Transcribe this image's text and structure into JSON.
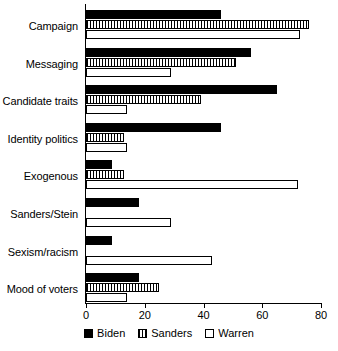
{
  "chart_data": {
    "type": "bar",
    "orientation": "horizontal",
    "title": "",
    "subtitle": "",
    "xlabel": "",
    "ylabel": "",
    "xlim": [
      0,
      80
    ],
    "xticks": [
      0,
      20,
      40,
      60,
      80
    ],
    "xtick_labels": [
      "0",
      "20",
      "40",
      "60",
      "80"
    ],
    "grid": false,
    "legend_position": "bottom",
    "categories": [
      "Campaign",
      "Messaging",
      "Candidate traits",
      "Identity politics",
      "Exogenous",
      "Sanders/Stein",
      "Sexism/racism",
      "Mood of voters"
    ],
    "series": [
      {
        "name": "Biden",
        "color": "#000000",
        "fill": "solid-black",
        "values": [
          46,
          56,
          65,
          46,
          9,
          18,
          9,
          18
        ]
      },
      {
        "name": "Sanders",
        "color": "#000000",
        "fill": "vertical-hatch",
        "values": [
          76,
          51,
          39,
          13,
          13,
          0,
          0,
          25
        ]
      },
      {
        "name": "Warren",
        "color": "#000000",
        "fill": "white-open",
        "values": [
          73,
          29,
          14,
          14,
          72,
          29,
          43,
          14
        ]
      }
    ]
  },
  "legend": {
    "items": [
      {
        "label": "Biden",
        "swatch": "solid-black-swatch"
      },
      {
        "label": "Sanders",
        "swatch": "hatched-swatch"
      },
      {
        "label": "Warren",
        "swatch": "open-swatch"
      }
    ]
  }
}
